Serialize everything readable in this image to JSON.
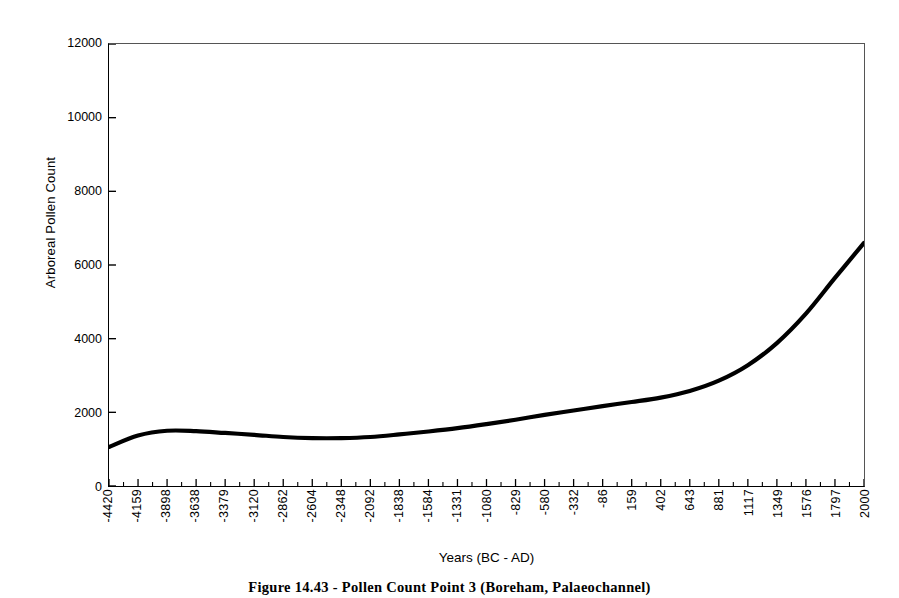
{
  "figure": {
    "caption": "Figure 14.43 - Pollen Count Point 3 (Boreham, Palaeochannel)"
  },
  "chart_data": {
    "type": "line",
    "title": "",
    "xlabel": "Years (BC - AD)",
    "ylabel": "Arboreal Pollen Count",
    "ylim": [
      0,
      12000
    ],
    "y_ticks": [
      0,
      2000,
      4000,
      6000,
      8000,
      10000,
      12000
    ],
    "grid": false,
    "legend": "none",
    "line_color": "#000000",
    "line_width": 4,
    "x_tick_labels": [
      "-4420",
      "-4159",
      "-3898",
      "-3638",
      "-3379",
      "-3120",
      "-2862",
      "-2604",
      "-2348",
      "-2092",
      "-1838",
      "-1584",
      "-1331",
      "-1080",
      "-829",
      "-580",
      "-332",
      "-86",
      "159",
      "402",
      "643",
      "881",
      "1117",
      "1349",
      "1576",
      "1797",
      "2000"
    ],
    "x": [
      -4420,
      -4159,
      -3898,
      -3638,
      -3379,
      -3120,
      -2862,
      -2604,
      -2348,
      -2092,
      -1838,
      -1584,
      -1331,
      -1080,
      -829,
      -580,
      -332,
      -86,
      159,
      402,
      643,
      881,
      1117,
      1349,
      1576,
      1797,
      2000
    ],
    "values": [
      1060,
      1370,
      1500,
      1490,
      1440,
      1390,
      1330,
      1300,
      1300,
      1330,
      1400,
      1480,
      1570,
      1680,
      1800,
      1930,
      2050,
      2170,
      2280,
      2400,
      2580,
      2860,
      3280,
      3880,
      4680,
      5650,
      6600
    ],
    "series": [
      {
        "name": "Arboreal Pollen Count",
        "values": [
          1060,
          1370,
          1500,
          1490,
          1440,
          1390,
          1330,
          1300,
          1300,
          1330,
          1400,
          1480,
          1570,
          1680,
          1800,
          1930,
          2050,
          2170,
          2280,
          2400,
          2580,
          2860,
          3280,
          3880,
          4680,
          5650,
          6600
        ]
      }
    ]
  }
}
